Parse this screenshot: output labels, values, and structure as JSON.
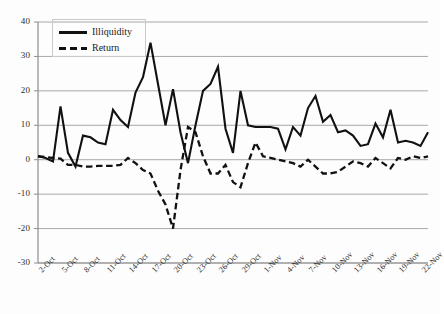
{
  "chart_data": {
    "type": "line",
    "title": "",
    "subtitle": "",
    "xlabel": "",
    "ylabel": "",
    "ylim": [
      -30,
      40
    ],
    "y_ticks": [
      40,
      30,
      20,
      10,
      0,
      -10,
      -20,
      -30
    ],
    "grid": true,
    "grid_axis": "y",
    "legend_position": "top-left-inside",
    "x": [
      "2-Oct",
      "3-Oct",
      "4-Oct",
      "5-Oct",
      "6-Oct",
      "7-Oct",
      "8-Oct",
      "9-Oct",
      "10-Oct",
      "11-Oct",
      "12-Oct",
      "13-Oct",
      "14-Oct",
      "15-Oct",
      "16-Oct",
      "17-Oct",
      "18-Oct",
      "19-Oct",
      "20-Oct",
      "21-Oct",
      "22-Oct",
      "23-Oct",
      "24-Oct",
      "25-Oct",
      "26-Oct",
      "27-Oct",
      "28-Oct",
      "29-Oct",
      "30-Oct",
      "31-Oct",
      "1-Nov",
      "2-Nov",
      "3-Nov",
      "4-Nov",
      "5-Nov",
      "6-Nov",
      "7-Nov",
      "8-Nov",
      "9-Nov",
      "10-Nov",
      "11-Nov",
      "12-Nov",
      "13-Nov",
      "14-Nov",
      "15-Nov",
      "16-Nov",
      "17-Nov",
      "18-Nov",
      "19-Nov",
      "20-Nov",
      "21-Nov",
      "22-Nov",
      "23-Nov"
    ],
    "x_tick_labels": [
      "2-Oct",
      "5-Oct",
      "8-Oct",
      "11-Oct",
      "14-Oct",
      "17-Oct",
      "20-Oct",
      "23-Oct",
      "26-Oct",
      "29-Oct",
      "1-Nov",
      "4-Nov",
      "7-Nov",
      "10-Nov",
      "13-Nov",
      "16-Nov",
      "19-Nov",
      "22-Nov"
    ],
    "x_tick_every": 3,
    "series": [
      {
        "name": "Illiquidity",
        "style": "solid",
        "color": "#111111",
        "values": [
          1.0,
          0.5,
          -0.5,
          15.5,
          2.0,
          -2.0,
          7.0,
          6.5,
          5.0,
          4.5,
          14.5,
          11.5,
          9.5,
          19.5,
          24.0,
          34.0,
          22.0,
          10.0,
          20.5,
          8.0,
          -1.0,
          10.0,
          20.0,
          22.0,
          27.0,
          9.0,
          2.0,
          20.0,
          10.0,
          9.5,
          9.5,
          9.5,
          9.0,
          3.0,
          9.5,
          7.0,
          15.0,
          18.5,
          11.0,
          13.0,
          8.0,
          8.5,
          7.0,
          4.0,
          4.5,
          10.5,
          6.5,
          14.5,
          5.0,
          5.5,
          5.0,
          4.0,
          8.0
        ]
      },
      {
        "name": "Return",
        "style": "dashed",
        "color": "#111111",
        "values": [
          1.0,
          0.8,
          0.5,
          0.3,
          -1.5,
          -1.5,
          -2.0,
          -2.0,
          -1.8,
          -1.8,
          -1.8,
          -1.5,
          0.5,
          -1.0,
          -3.0,
          -4.0,
          -9.0,
          -13.0,
          -20.0,
          -3.0,
          9.5,
          8.0,
          1.0,
          -4.0,
          -4.0,
          -1.5,
          -6.5,
          -8.0,
          -1.0,
          5.0,
          1.0,
          0.5,
          0.0,
          -0.5,
          -1.0,
          -2.0,
          0.0,
          -2.0,
          -4.0,
          -4.0,
          -3.5,
          -2.0,
          -0.5,
          -1.0,
          -2.0,
          0.5,
          -1.0,
          -2.5,
          0.5,
          0.0,
          1.0,
          0.5,
          1.0
        ]
      }
    ]
  },
  "legend": {
    "items": [
      {
        "label": "Illiquidity",
        "style": "solid"
      },
      {
        "label": "Return",
        "style": "dashed"
      }
    ]
  }
}
